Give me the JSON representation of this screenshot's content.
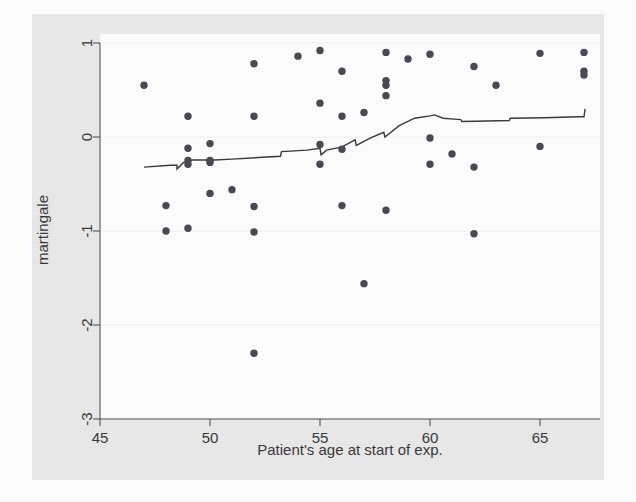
{
  "chart_data": {
    "type": "scatter",
    "title": "",
    "xlabel": "Patient's age at start of exp.",
    "ylabel": "martingale",
    "xlim": [
      45,
      67.6
    ],
    "ylim": [
      -3.1,
      1.05
    ],
    "xticks": [
      45,
      50,
      55,
      60,
      65
    ],
    "yticks": [
      1,
      0,
      -1,
      -2,
      -3
    ],
    "xtick_labels": [
      "45",
      "50",
      "55",
      "60",
      "65"
    ],
    "ytick_labels": [
      "1",
      "0",
      "-1",
      "-2",
      "-3"
    ],
    "grid": "horizontal-at-yticks",
    "legend": "none",
    "marker_color": "#4b4b55",
    "line_color": "#3b3b3b",
    "plot_background": "#ffffff",
    "graph_background": "#ebebeb",
    "series": [
      {
        "name": "martingale residuals",
        "type": "scatter",
        "points": [
          [
            47.0,
            0.55
          ],
          [
            48.0,
            -0.73
          ],
          [
            48.0,
            -1.0
          ],
          [
            49.0,
            0.22
          ],
          [
            49.0,
            -0.12
          ],
          [
            49.0,
            -0.25
          ],
          [
            49.0,
            -0.29
          ],
          [
            49.0,
            -0.97
          ],
          [
            50.0,
            -0.07
          ],
          [
            50.0,
            -0.25
          ],
          [
            50.0,
            -0.27
          ],
          [
            50.0,
            -0.6
          ],
          [
            51.0,
            -0.56
          ],
          [
            52.0,
            0.78
          ],
          [
            52.0,
            0.22
          ],
          [
            52.0,
            -0.74
          ],
          [
            52.0,
            -1.01
          ],
          [
            52.0,
            -2.3
          ],
          [
            54.0,
            0.86
          ],
          [
            55.0,
            0.92
          ],
          [
            55.0,
            0.36
          ],
          [
            55.0,
            -0.08
          ],
          [
            55.0,
            -0.29
          ],
          [
            56.0,
            0.7
          ],
          [
            56.0,
            0.22
          ],
          [
            56.0,
            -0.13
          ],
          [
            56.0,
            -0.73
          ],
          [
            57.0,
            0.26
          ],
          [
            57.0,
            -1.56
          ],
          [
            58.0,
            0.9
          ],
          [
            58.0,
            0.6
          ],
          [
            58.0,
            0.55
          ],
          [
            58.0,
            0.44
          ],
          [
            58.0,
            -0.78
          ],
          [
            59.0,
            0.83
          ],
          [
            60.0,
            0.88
          ],
          [
            60.0,
            -0.01
          ],
          [
            60.0,
            -0.29
          ],
          [
            61.0,
            -0.18
          ],
          [
            62.0,
            0.75
          ],
          [
            62.0,
            -0.32
          ],
          [
            62.0,
            -1.03
          ],
          [
            63.0,
            0.55
          ],
          [
            65.0,
            0.89
          ],
          [
            65.0,
            -0.1
          ],
          [
            67.0,
            0.9
          ],
          [
            67.0,
            0.7
          ],
          [
            67.0,
            0.66
          ]
        ]
      },
      {
        "name": "smoothed trend",
        "type": "line",
        "points": [
          [
            47.0,
            -0.32
          ],
          [
            48.2,
            -0.3
          ],
          [
            48.5,
            -0.3
          ],
          [
            48.5,
            -0.34
          ],
          [
            48.8,
            -0.27
          ],
          [
            49.2,
            -0.245
          ],
          [
            50.2,
            -0.245
          ],
          [
            51.0,
            -0.235
          ],
          [
            53.2,
            -0.205
          ],
          [
            53.25,
            -0.155
          ],
          [
            54.4,
            -0.14
          ],
          [
            55.0,
            -0.12
          ],
          [
            55.05,
            -0.19
          ],
          [
            55.3,
            -0.14
          ],
          [
            56.0,
            -0.105
          ],
          [
            56.6,
            -0.03
          ],
          [
            56.65,
            -0.09
          ],
          [
            57.3,
            -0.01
          ],
          [
            57.9,
            0.05
          ],
          [
            57.95,
            0.0
          ],
          [
            58.6,
            0.12
          ],
          [
            59.3,
            0.2
          ],
          [
            60.0,
            0.225
          ],
          [
            60.2,
            0.235
          ],
          [
            60.6,
            0.2
          ],
          [
            61.1,
            0.19
          ],
          [
            61.4,
            0.185
          ],
          [
            61.45,
            0.165
          ],
          [
            62.6,
            0.17
          ],
          [
            63.6,
            0.175
          ],
          [
            63.65,
            0.2
          ],
          [
            65.2,
            0.205
          ],
          [
            66.8,
            0.215
          ],
          [
            67.0,
            0.215
          ],
          [
            67.05,
            0.3
          ]
        ]
      }
    ]
  },
  "axes": {
    "x_title": "Patient's age at start of exp.",
    "y_title": "martingale"
  }
}
